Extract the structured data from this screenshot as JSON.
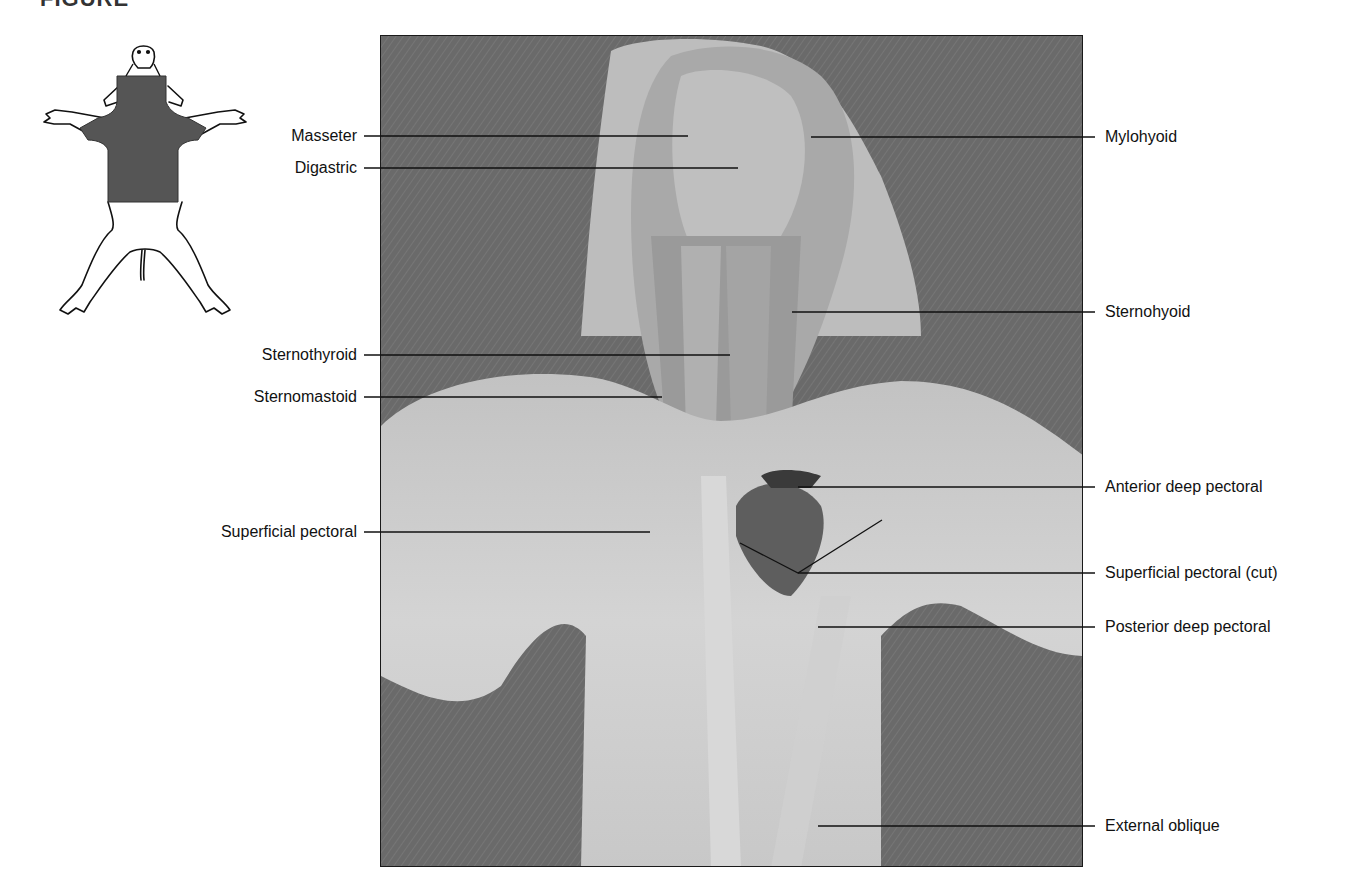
{
  "figure": {
    "heading_fragment": "FIGURE",
    "inset": {
      "description": "ventral view outline of fetal pig with neck and thoracic region shaded",
      "shade_color": "#555555"
    },
    "photo": {
      "description": "dissected ventral neck and thorax muscles",
      "background_color": "#6e6e6e",
      "tissue_color": "#cfcfcf"
    },
    "labels_left": [
      {
        "id": "masseter",
        "text": "Masseter",
        "y": 136
      },
      {
        "id": "digastric",
        "text": "Digastric",
        "y": 168
      },
      {
        "id": "sternothyroid",
        "text": "Sternothyroid",
        "y": 355
      },
      {
        "id": "sternomastoid",
        "text": "Sternomastoid",
        "y": 397
      },
      {
        "id": "superficial-pectoral",
        "text": "Superficial pectoral",
        "y": 532
      }
    ],
    "labels_right": [
      {
        "id": "mylohyoid",
        "text": "Mylohyoid",
        "y": 137
      },
      {
        "id": "sternohyoid",
        "text": "Sternohyoid",
        "y": 312
      },
      {
        "id": "anterior-deep-pectoral",
        "text": "Anterior deep pectoral",
        "y": 487
      },
      {
        "id": "superficial-pectoral-cut",
        "text": "Superficial pectoral (cut)",
        "y": 573
      },
      {
        "id": "posterior-deep-pectoral",
        "text": "Posterior deep pectoral",
        "y": 627
      },
      {
        "id": "external-oblique",
        "text": "External oblique",
        "y": 826
      }
    ]
  }
}
